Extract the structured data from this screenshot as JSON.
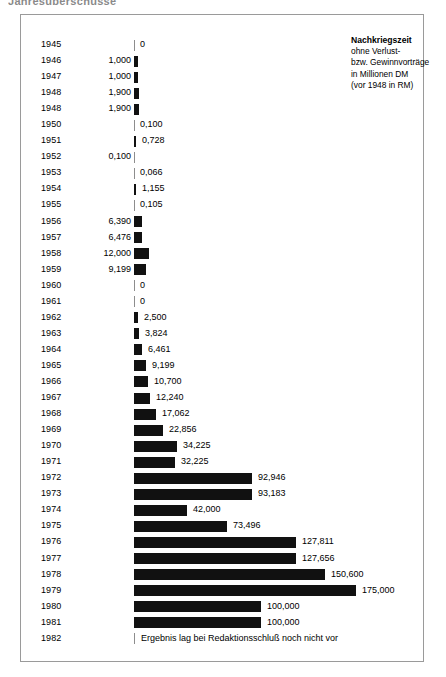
{
  "top_headline": "Jahresüberschüsse",
  "legend": {
    "title": "Nachkriegszeit",
    "line2": "ohne Verlust-",
    "line3": "bzw. Gewinnvorträge",
    "line4": "in Millionen DM",
    "line5": "(vor 1948 in RM)"
  },
  "colors": {
    "bar": "#111111",
    "axis": "#8d8d8d",
    "frame": "#9a9a9a",
    "text": "#000000"
  },
  "footer_note": "Ergebnis lag bei Redaktionsschluß noch nicht vor",
  "chart_data": {
    "type": "bar",
    "orientation": "horizontal",
    "title": "Nachkriegszeit",
    "subtitle": "ohne Verlust- bzw. Gewinnvorträge in Millionen DM (vor 1948 in RM)",
    "xlabel": "",
    "ylabel": "",
    "grid": false,
    "legend_position": "top-right",
    "xlim": [
      0,
      175000
    ],
    "categories": [
      "1945",
      "1946",
      "1947",
      "1948",
      "1948",
      "1950",
      "1951",
      "1952",
      "1953",
      "1954",
      "1955",
      "1956",
      "1957",
      "1958",
      "1959",
      "1960",
      "1961",
      "1962",
      "1963",
      "1964",
      "1965",
      "1966",
      "1967",
      "1968",
      "1969",
      "1970",
      "1971",
      "1972",
      "1973",
      "1974",
      "1975",
      "1976",
      "1977",
      "1978",
      "1979",
      "1980",
      "1981",
      "1982"
    ],
    "values": [
      0,
      1000,
      1000,
      1900,
      1900,
      0.1,
      0.728,
      0.1,
      0.066,
      1.155,
      0.105,
      6390,
      6476,
      12000,
      9199,
      0,
      0,
      2500,
      3824,
      6461,
      9199,
      10700,
      12240,
      17062,
      22856,
      34225,
      32225,
      92946,
      93183,
      42000,
      73496,
      127811,
      127656,
      150600,
      175000,
      100000,
      100000,
      null
    ],
    "labels": [
      "0",
      "1,000",
      "1,000",
      "1,900",
      "1,900",
      "0,100",
      "0,728",
      "0,100",
      "0,066",
      "1,155",
      "0,105",
      "6,390",
      "6,476",
      "12,000",
      "9,199",
      "0",
      "0",
      "2,500",
      "3,824",
      "6,461",
      "9,199",
      "10,700",
      "12,240",
      "17,062",
      "22,856",
      "34,225",
      "32,225",
      "92,946",
      "93,183",
      "42,000",
      "73,496",
      "127,811",
      "127,656",
      "150,600",
      "175,000",
      "100,000",
      "100,000",
      "Ergebnis lag bei Redaktionsschluß noch nicht vor"
    ]
  },
  "rows": [
    {
      "year": "1945",
      "label": "0",
      "side": "right",
      "w": 0
    },
    {
      "year": "1946",
      "label": "1,000",
      "side": "left",
      "w": 4
    },
    {
      "year": "1947",
      "label": "1,000",
      "side": "left",
      "w": 4
    },
    {
      "year": "1948",
      "label": "1,900",
      "side": "left",
      "w": 5
    },
    {
      "year": "1948",
      "label": "1,900",
      "side": "left",
      "w": 5
    },
    {
      "year": "1950",
      "label": "0,100",
      "side": "right",
      "w": 0
    },
    {
      "year": "1951",
      "label": "0,728",
      "side": "right",
      "w": 2
    },
    {
      "year": "1952",
      "label": "0,100",
      "side": "left",
      "w": 0
    },
    {
      "year": "1953",
      "label": "0,066",
      "side": "right",
      "w": 0
    },
    {
      "year": "1954",
      "label": "1,155",
      "side": "right",
      "w": 2
    },
    {
      "year": "1955",
      "label": "0,105",
      "side": "right",
      "w": 0
    },
    {
      "year": "1956",
      "label": "6,390",
      "side": "left",
      "w": 8
    },
    {
      "year": "1957",
      "label": "6,476",
      "side": "left",
      "w": 8
    },
    {
      "year": "1958",
      "label": "12,000",
      "side": "left",
      "w": 15
    },
    {
      "year": "1959",
      "label": "9,199",
      "side": "left",
      "w": 12
    },
    {
      "year": "1960",
      "label": "0",
      "side": "right",
      "w": 0
    },
    {
      "year": "1961",
      "label": "0",
      "side": "right",
      "w": 0
    },
    {
      "year": "1962",
      "label": "2,500",
      "side": "right",
      "w": 4
    },
    {
      "year": "1963",
      "label": "3,824",
      "side": "right",
      "w": 5
    },
    {
      "year": "1964",
      "label": "6,461",
      "side": "right",
      "w": 8
    },
    {
      "year": "1965",
      "label": "9,199",
      "side": "right",
      "w": 12
    },
    {
      "year": "1966",
      "label": "10,700",
      "side": "right",
      "w": 14
    },
    {
      "year": "1967",
      "label": "12,240",
      "side": "right",
      "w": 16
    },
    {
      "year": "1968",
      "label": "17,062",
      "side": "right",
      "w": 22
    },
    {
      "year": "1969",
      "label": "22,856",
      "side": "right",
      "w": 29
    },
    {
      "year": "1970",
      "label": "34,225",
      "side": "right",
      "w": 43
    },
    {
      "year": "1971",
      "label": "32,225",
      "side": "right",
      "w": 41
    },
    {
      "year": "1972",
      "label": "92,946",
      "side": "right",
      "w": 118
    },
    {
      "year": "1973",
      "label": "93,183",
      "side": "right",
      "w": 118
    },
    {
      "year": "1974",
      "label": "42,000",
      "side": "right",
      "w": 53
    },
    {
      "year": "1975",
      "label": "73,496",
      "side": "right",
      "w": 93
    },
    {
      "year": "1976",
      "label": "127,811",
      "side": "right",
      "w": 162
    },
    {
      "year": "1977",
      "label": "127,656",
      "side": "right",
      "w": 162
    },
    {
      "year": "1978",
      "label": "150,600",
      "side": "right",
      "w": 191
    },
    {
      "year": "1979",
      "label": "175,000",
      "side": "right",
      "w": 222
    },
    {
      "year": "1980",
      "label": "100,000",
      "side": "right",
      "w": 127
    },
    {
      "year": "1981",
      "label": "100,000",
      "side": "right",
      "w": 127
    },
    {
      "year": "1982",
      "label": "Ergebnis lag bei Redaktionsschluß noch nicht vor",
      "side": "note",
      "w": 0
    }
  ]
}
